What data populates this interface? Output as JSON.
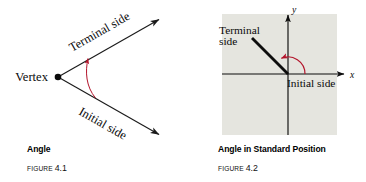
{
  "page": {
    "background_color": "#ffffff",
    "width": 366,
    "height": 182
  },
  "figures": [
    {
      "id": "angle",
      "caption_title": "Angle",
      "figure_word": "FIGURE",
      "figure_number": "4.1",
      "vertex_label": "Vertex",
      "terminal_label": "Terminal side",
      "initial_label": "Initial side",
      "stroke_color": "#1a1a1a",
      "arc_color": "#b3142b"
    },
    {
      "id": "standard-position",
      "caption_title": "Angle in Standard Position",
      "figure_word": "FIGURE",
      "figure_number": "4.2",
      "terminal_label_line1": "Terminal",
      "terminal_label_line2": "side",
      "initial_label": "Initial side",
      "x_axis_label": "x",
      "y_axis_label": "y",
      "plot_background": "#e5e5df",
      "stroke_color": "#0d0d0d",
      "arc_color": "#b3142b"
    }
  ]
}
